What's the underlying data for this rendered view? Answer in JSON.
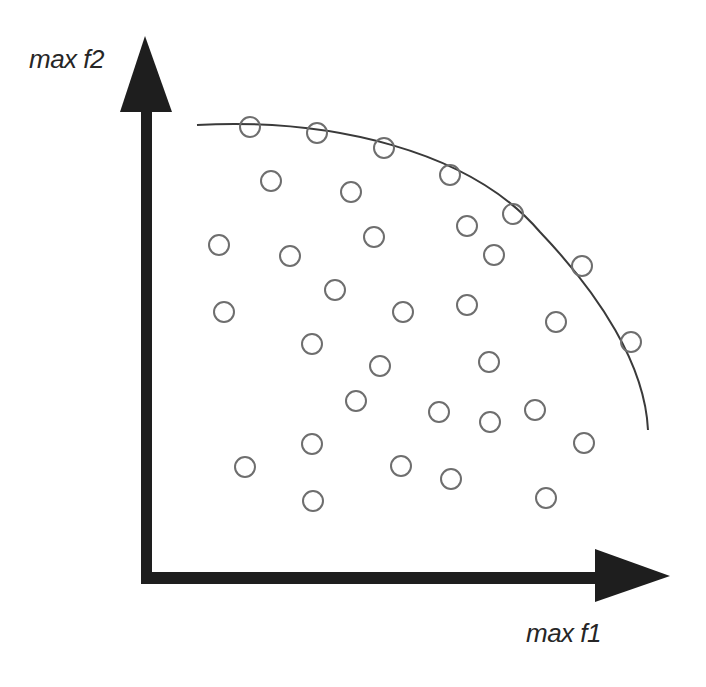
{
  "diagram": {
    "axes": {
      "x_label": "max f1",
      "y_label": "max f2"
    },
    "colors": {
      "axis": "#1e1e1e",
      "front_curve": "#3a3a3a",
      "point_stroke": "#6e6e6e",
      "label": "#262626",
      "background": "#ffffff"
    },
    "pareto_front_points": [
      {
        "x": 250,
        "y": 127
      },
      {
        "x": 317,
        "y": 133
      },
      {
        "x": 384,
        "y": 148
      },
      {
        "x": 450,
        "y": 175
      },
      {
        "x": 513,
        "y": 214
      },
      {
        "x": 582,
        "y": 266
      },
      {
        "x": 631,
        "y": 342
      }
    ],
    "dominated_points": [
      {
        "x": 271,
        "y": 181
      },
      {
        "x": 351,
        "y": 192
      },
      {
        "x": 219,
        "y": 245
      },
      {
        "x": 290,
        "y": 256
      },
      {
        "x": 374,
        "y": 237
      },
      {
        "x": 467,
        "y": 226
      },
      {
        "x": 494,
        "y": 255
      },
      {
        "x": 224,
        "y": 312
      },
      {
        "x": 335,
        "y": 290
      },
      {
        "x": 403,
        "y": 312
      },
      {
        "x": 467,
        "y": 305
      },
      {
        "x": 556,
        "y": 322
      },
      {
        "x": 312,
        "y": 344
      },
      {
        "x": 380,
        "y": 366
      },
      {
        "x": 489,
        "y": 362
      },
      {
        "x": 356,
        "y": 401
      },
      {
        "x": 439,
        "y": 412
      },
      {
        "x": 490,
        "y": 422
      },
      {
        "x": 535,
        "y": 410
      },
      {
        "x": 584,
        "y": 443
      },
      {
        "x": 312,
        "y": 444
      },
      {
        "x": 245,
        "y": 467
      },
      {
        "x": 401,
        "y": 466
      },
      {
        "x": 451,
        "y": 479
      },
      {
        "x": 313,
        "y": 501
      },
      {
        "x": 546,
        "y": 498
      }
    ],
    "point_radius": 10,
    "front_curve_path": "M 197 125 C 330 118, 470 150, 540 232 C 600 295, 645 365, 648 430"
  }
}
